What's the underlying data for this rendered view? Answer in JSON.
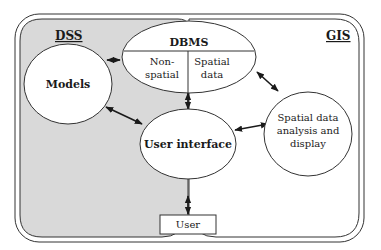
{
  "diagram": {
    "regions": {
      "dss": {
        "label": "DSS",
        "fill": "#d9d9d9"
      },
      "gis": {
        "label": "GIS",
        "fill": "#ffffff"
      }
    },
    "nodes": {
      "dbms": {
        "title": "DBMS",
        "left_line1": "Non-",
        "left_line2": "spatial",
        "right_line1": "Spatial",
        "right_line2": "data"
      },
      "models": {
        "label": "Models"
      },
      "user_interface": {
        "label": "User interface"
      },
      "spatial_analysis": {
        "line1": "Spatial data",
        "line2": "analysis and",
        "line3": "display"
      },
      "user": {
        "label": "User"
      }
    },
    "edges": [
      {
        "from": "models",
        "to": "dbms",
        "type": "bidirectional"
      },
      {
        "from": "models",
        "to": "user_interface",
        "type": "bidirectional"
      },
      {
        "from": "dbms",
        "to": "user_interface",
        "type": "bidirectional"
      },
      {
        "from": "dbms",
        "to": "spatial_analysis",
        "type": "bidirectional"
      },
      {
        "from": "user_interface",
        "to": "spatial_analysis",
        "type": "bidirectional"
      },
      {
        "from": "user_interface",
        "to": "user",
        "type": "bidirectional"
      }
    ],
    "colors": {
      "stroke": "#333333",
      "shade": "#d9d9d9",
      "background": "#ffffff"
    }
  }
}
